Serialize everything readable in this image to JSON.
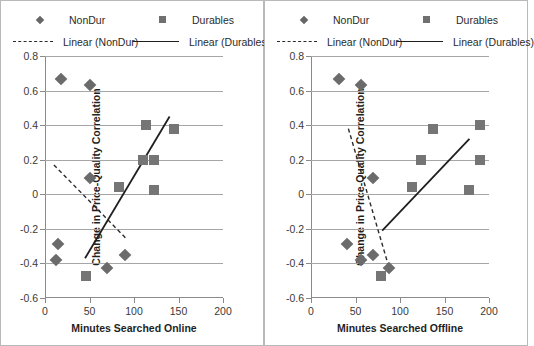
{
  "figure": {
    "panel_count": 2,
    "background": "#ffffff",
    "gridline_color": "#a6a6a6",
    "nondur_color": "#6b6b6b",
    "durables_color": "#757575",
    "trend_nondur_color": "#2b2b2b",
    "trend_durables_color": "#1f1f1f"
  },
  "legend": {
    "nondur": "NonDur",
    "durables": "Durables",
    "linear_nondur": "Linear (NonDur)",
    "linear_durables": "Linear (Durables)"
  },
  "chart_data": [
    {
      "type": "scatter",
      "panel": "left",
      "title": "",
      "xlabel": "Minutes Searched Online",
      "ylabel": "Change in Price-Quality Correlation",
      "xlim": [
        0,
        200
      ],
      "ylim": [
        -0.6,
        0.8
      ],
      "xticks": [
        0,
        50,
        100,
        150,
        200
      ],
      "yticks": [
        -0.6,
        -0.4,
        -0.2,
        0,
        0.2,
        0.4,
        0.6,
        0.8
      ],
      "xtick_labels": [
        "0",
        "50",
        "100",
        "150",
        "200"
      ],
      "ytick_labels": [
        "-0.6",
        "-0.4",
        "-0.2",
        "0",
        "0.2",
        "0.4",
        "0.6",
        "0.8"
      ],
      "grid": true,
      "legend_position": "top",
      "series": [
        {
          "name": "NonDur",
          "marker": "diamond",
          "points": [
            {
              "x": 18,
              "y": 0.665
            },
            {
              "x": 50,
              "y": 0.63
            },
            {
              "x": 50,
              "y": 0.095
            },
            {
              "x": 15,
              "y": -0.29
            },
            {
              "x": 12,
              "y": -0.38
            },
            {
              "x": 70,
              "y": -0.425
            },
            {
              "x": 90,
              "y": -0.35
            }
          ]
        },
        {
          "name": "Durables",
          "marker": "square",
          "points": [
            {
              "x": 113,
              "y": 0.4
            },
            {
              "x": 145,
              "y": 0.375
            },
            {
              "x": 110,
              "y": 0.2
            },
            {
              "x": 123,
              "y": 0.2
            },
            {
              "x": 83,
              "y": 0.045
            },
            {
              "x": 123,
              "y": 0.025
            },
            {
              "x": 46,
              "y": -0.475
            }
          ]
        }
      ],
      "trendlines": [
        {
          "name": "Linear (NonDur)",
          "style": "dashed",
          "x0": 10,
          "y0": 0.17,
          "x1": 92,
          "y1": -0.26
        },
        {
          "name": "Linear (Durables)",
          "style": "solid",
          "x0": 45,
          "y0": -0.37,
          "x1": 140,
          "y1": 0.45
        }
      ]
    },
    {
      "type": "scatter",
      "panel": "right",
      "title": "",
      "xlabel": "Minutes Searched Offline",
      "ylabel": "Change in Price-Quality Correlation",
      "xlim": [
        0,
        200
      ],
      "ylim": [
        -0.6,
        0.8
      ],
      "xticks": [
        0,
        50,
        100,
        150,
        200
      ],
      "yticks": [
        -0.6,
        -0.4,
        -0.2,
        0,
        0.2,
        0.4,
        0.6,
        0.8
      ],
      "xtick_labels": [
        "0",
        "50",
        "100",
        "150",
        "200"
      ],
      "ytick_labels": [
        "-0.6",
        "-0.4",
        "-0.2",
        "0",
        "0.2",
        "0.4",
        "0.6",
        "0.8"
      ],
      "grid": true,
      "legend_position": "top",
      "series": [
        {
          "name": "NonDur",
          "marker": "diamond",
          "points": [
            {
              "x": 32,
              "y": 0.665
            },
            {
              "x": 56,
              "y": 0.63
            },
            {
              "x": 70,
              "y": 0.095
            },
            {
              "x": 41,
              "y": -0.29
            },
            {
              "x": 70,
              "y": -0.35
            },
            {
              "x": 56,
              "y": -0.38
            },
            {
              "x": 88,
              "y": -0.425
            }
          ]
        },
        {
          "name": "Durables",
          "marker": "square",
          "points": [
            {
              "x": 137,
              "y": 0.375
            },
            {
              "x": 190,
              "y": 0.4
            },
            {
              "x": 124,
              "y": 0.2
            },
            {
              "x": 190,
              "y": 0.2
            },
            {
              "x": 113,
              "y": 0.045
            },
            {
              "x": 178,
              "y": 0.025
            },
            {
              "x": 79,
              "y": -0.475
            }
          ]
        }
      ],
      "trendlines": [
        {
          "name": "Linear (NonDur)",
          "style": "dashed",
          "x0": 42,
          "y0": 0.38,
          "x1": 88,
          "y1": -0.43
        },
        {
          "name": "Linear (Durables)",
          "style": "solid",
          "x0": 80,
          "y0": -0.21,
          "x1": 178,
          "y1": 0.32
        }
      ]
    }
  ]
}
